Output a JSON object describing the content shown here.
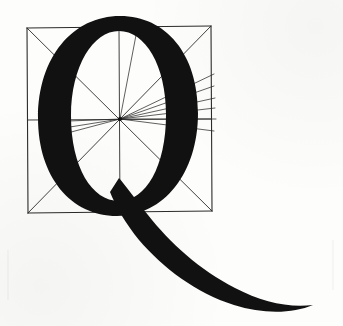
{
  "figure": {
    "letter": "Q",
    "colors": {
      "ink": "#111111",
      "guide": "#2b2b2b",
      "paper": "#fdfdfb",
      "caption": "#9a9a94"
    },
    "margin_notes": {
      "left": "",
      "right": ""
    },
    "construction": {
      "square_label": "construction-square",
      "center_label": "radiating-center",
      "ray_count": 9
    }
  }
}
